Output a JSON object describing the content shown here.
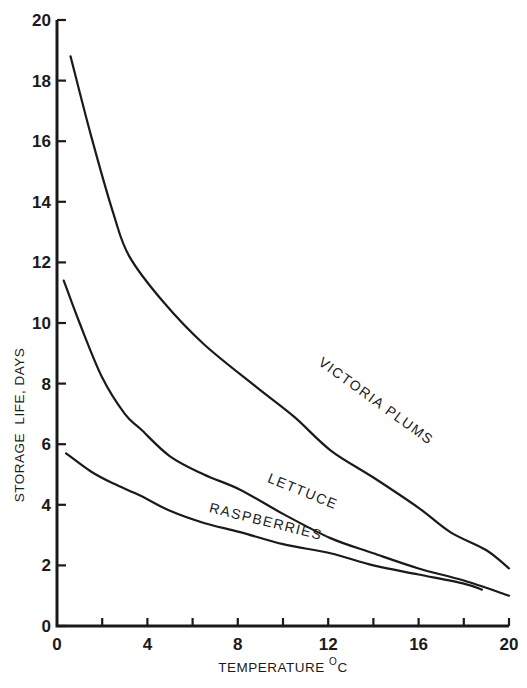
{
  "chart_data": {
    "type": "line",
    "title": "",
    "xlabel": "TEMPERATURE °C",
    "xlabel_main": "TEMPERATURE ",
    "xlabel_sup": "O",
    "xlabel_unit": "C",
    "ylabel": "STORAGE  LIFE, DAYS",
    "xlim": [
      0,
      20
    ],
    "ylim": [
      0,
      20
    ],
    "x_ticks": [
      0,
      2,
      4,
      6,
      8,
      10,
      12,
      14,
      16,
      18,
      20
    ],
    "x_tick_labels": [
      "0",
      "4",
      "8",
      "12",
      "16",
      "20"
    ],
    "x_tick_label_values": [
      0,
      4,
      8,
      12,
      16,
      20
    ],
    "y_ticks": [
      0,
      2,
      4,
      6,
      8,
      10,
      12,
      14,
      16,
      18,
      20
    ],
    "y_tick_labels": [
      "0",
      "2",
      "4",
      "6",
      "8",
      "10",
      "12",
      "14",
      "16",
      "18",
      "20"
    ],
    "grid": false,
    "legend": "inline labels on curves",
    "series": [
      {
        "name": "VICTORIA PLUMS",
        "x": [
          0.6,
          1.5,
          2.5,
          3.2,
          4.7,
          6.5,
          8.8,
          10.5,
          12.1,
          14.0,
          16.0,
          17.4,
          19.0,
          20.0
        ],
        "values": [
          18.8,
          16.2,
          13.6,
          12.2,
          10.7,
          9.3,
          7.9,
          6.9,
          5.8,
          4.9,
          3.9,
          3.1,
          2.5,
          1.9
        ]
      },
      {
        "name": "LETTUCE",
        "x": [
          0.3,
          1.0,
          2.0,
          3.0,
          3.7,
          5.0,
          6.5,
          8.1,
          10.0,
          12.1,
          14.0,
          16.0,
          18.0,
          20.0
        ],
        "values": [
          11.4,
          10.0,
          8.2,
          7.0,
          6.5,
          5.6,
          5.0,
          4.5,
          3.7,
          2.9,
          2.4,
          1.9,
          1.5,
          1.0
        ]
      },
      {
        "name": "RASPBERRIES",
        "x": [
          0.4,
          1.5,
          2.5,
          3.7,
          5.0,
          6.5,
          8.1,
          10.0,
          12.1,
          14.0,
          16.0,
          18.0,
          18.8
        ],
        "values": [
          5.7,
          5.1,
          4.7,
          4.3,
          3.8,
          3.4,
          3.1,
          2.7,
          2.4,
          2.0,
          1.7,
          1.4,
          1.2
        ]
      }
    ],
    "annotations": [
      {
        "text": "VICTORIA PLUMS",
        "x": 14.0,
        "y": 7.3,
        "angle": 36
      },
      {
        "text": "LETTUCE",
        "x": 10.8,
        "y": 4.3,
        "angle": 22
      },
      {
        "text": "RASPBERRIES",
        "x": 9.2,
        "y": 3.3,
        "angle": 14
      }
    ]
  },
  "style": {
    "ink_color": "#1a1a1a",
    "background": "#ffffff"
  }
}
